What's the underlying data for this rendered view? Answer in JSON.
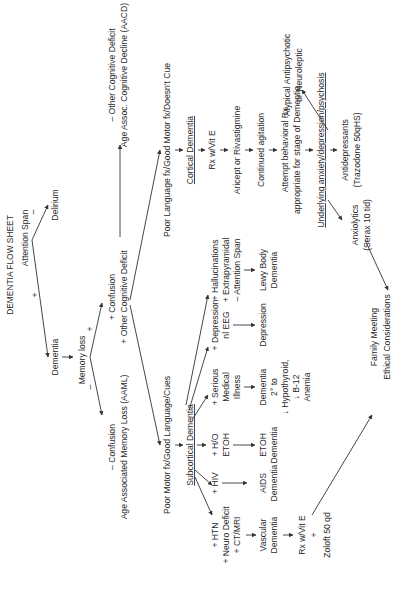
{
  "title": "DEMENTIA FLOW SHEET",
  "nodes": {
    "attention_span": "Attention Span",
    "delirium": "Delirium",
    "dementia": "Dementia",
    "memory_loss": "Memory loss",
    "plus_sign": "+",
    "minus_sign": "–",
    "neg_other_1": "– Other Cognitive Deficit",
    "neg_other_2": "Age Assoc. Cognitive Decline (AACD)",
    "pos_conf_1": "+ Confusion",
    "pos_conf_2": "+ Other Cognitive Deficit",
    "neg_conf_1": "– Confusion",
    "neg_conf_2": "Age Associated Memory Loss (AAML)",
    "poor_language": "Poor Language fx/Good Motor fx/Doesn't Cue",
    "poor_motor": "Poor Motor fx/Good Language/Cues",
    "cortical": "Cortical Dementia",
    "rx_vit_e": "Rx w/Vit E",
    "aricept": "Aricept or Rivastigmine",
    "continued_agitation": "Continued agitation",
    "attempt_1": "Attempt behavioral Rx",
    "attempt_2": "appropriate for stage of Dementia",
    "underlying": "Underlying anxiety/depression/psychosis",
    "anxiolytics_1": "Anxiolytics",
    "anxiolytics_2": "(Serax 10 tid)",
    "antidepressants_1": "Antidepressants",
    "antidepressants_2": "(Trazodone 50qHS)",
    "atypical_1": "Atypical Antipsychotic",
    "atypical_2": "or Neuroleptic",
    "subcortical": "Subcortical Dementia",
    "htn_1": "+ HTN",
    "htn_2": "+ Neuro Deficit",
    "htn_3": "+ CT/MRI",
    "vascular_1": "Vascular",
    "vascular_2": "Dementia",
    "vasc_rx_1": "Rx w/Vit E",
    "vasc_rx_2": "+",
    "vasc_rx_3": "Zoloft 50 qd",
    "hiv": "+ HIV",
    "aids_1": "AIDS",
    "aids_2": "Dementia",
    "etoh_1": "+ H/O",
    "etoh_2": "ETOH",
    "etoh_dem_1": "ETOH",
    "etoh_dem_2": "Dementia",
    "serious_1": "+ Serious",
    "serious_2": "Medical",
    "serious_3": "Illness",
    "dem2_1": "Dementia",
    "dem2_2": "2° to",
    "dem2_3": "↓ Hypothyroid,",
    "dem2_4": "↓ B-12",
    "dem2_5": "Anemia",
    "depr_1": "+ Depression",
    "depr_2": "nl EEG",
    "depression": "Depression",
    "lewy_in_1": "+ Hallucinations",
    "lewy_in_2": "+ Extrapyramidal",
    "lewy_in_3": "– Attention Span",
    "lewy_1": "Lewy Body",
    "lewy_2": "Dementia",
    "family_1": "Family Meeting",
    "family_2": "Ethical Considerations"
  }
}
